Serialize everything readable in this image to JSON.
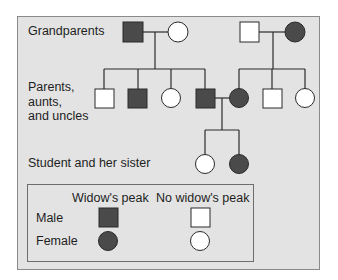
{
  "diagram": {
    "type": "pedigree",
    "trait": "Widow's peak",
    "colors": {
      "background": "#e3e3e3",
      "affected_fill": "#4a4a4a",
      "unaffected_fill": "#ffffff",
      "line": "#2a2a2a"
    },
    "generation_labels": {
      "grandparents": "Grandparents",
      "parents": "Parents,\naunts,\nand uncles",
      "children": "Student and her sister"
    },
    "generations": [
      {
        "name": "Grandparents",
        "individuals": [
          {
            "id": "gp1",
            "sex": "male",
            "widows_peak": true
          },
          {
            "id": "gp2",
            "sex": "female",
            "widows_peak": false
          },
          {
            "id": "gp3",
            "sex": "male",
            "widows_peak": false
          },
          {
            "id": "gp4",
            "sex": "female",
            "widows_peak": true
          }
        ]
      },
      {
        "name": "Parents, aunts, and uncles",
        "individuals": [
          {
            "id": "p1",
            "sex": "male",
            "widows_peak": false,
            "parents": [
              "gp1",
              "gp2"
            ]
          },
          {
            "id": "p2",
            "sex": "male",
            "widows_peak": true,
            "parents": [
              "gp1",
              "gp2"
            ]
          },
          {
            "id": "p3",
            "sex": "female",
            "widows_peak": false,
            "parents": [
              "gp1",
              "gp2"
            ]
          },
          {
            "id": "p4",
            "sex": "male",
            "widows_peak": true,
            "parents": [
              "gp1",
              "gp2"
            ]
          },
          {
            "id": "p5",
            "sex": "female",
            "widows_peak": true,
            "parents": [
              "gp3",
              "gp4"
            ]
          },
          {
            "id": "p6",
            "sex": "male",
            "widows_peak": false,
            "parents": [
              "gp3",
              "gp4"
            ]
          },
          {
            "id": "p7",
            "sex": "female",
            "widows_peak": false,
            "parents": [
              "gp3",
              "gp4"
            ]
          }
        ]
      },
      {
        "name": "Student and her sister",
        "individuals": [
          {
            "id": "c1",
            "sex": "female",
            "widows_peak": false,
            "parents": [
              "p4",
              "p5"
            ]
          },
          {
            "id": "c2",
            "sex": "female",
            "widows_peak": true,
            "parents": [
              "p4",
              "p5"
            ]
          }
        ]
      }
    ],
    "legend": {
      "col_headers": [
        "Widow's peak",
        "No widow's peak"
      ],
      "row_labels": [
        "Male",
        "Female"
      ]
    }
  }
}
